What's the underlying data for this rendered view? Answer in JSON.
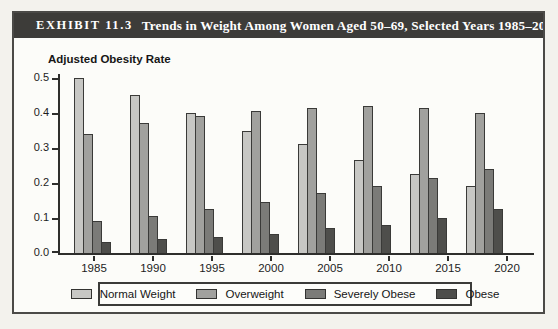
{
  "exhibit": {
    "label": "EXHIBIT 11.3",
    "title": "Trends in Weight Among Women Aged 50–69, Selected Years 1985–2020"
  },
  "chart_data": {
    "type": "bar",
    "title": "Adjusted Obesity Rate",
    "xlabel": "",
    "ylabel": "Adjusted Obesity Rate",
    "ylim": [
      0,
      0.5
    ],
    "yticks": [
      0.0,
      0.1,
      0.2,
      0.3,
      0.4,
      0.5
    ],
    "grid": false,
    "legend_position": "bottom",
    "categories": [
      "1985",
      "1990",
      "1995",
      "2000",
      "2005",
      "2010",
      "2015",
      "2020"
    ],
    "series": [
      {
        "name": "Normal Weight",
        "color": "#c7c7c4",
        "values": [
          0.5,
          0.45,
          0.4,
          0.35,
          0.31,
          0.265,
          0.225,
          0.19
        ]
      },
      {
        "name": "Overweight",
        "color": "#a1a19e",
        "values": [
          0.34,
          0.37,
          0.39,
          0.405,
          0.415,
          0.42,
          0.415,
          0.4
        ]
      },
      {
        "name": "Severely Obese",
        "color": "#7b7b78",
        "values": [
          0.09,
          0.105,
          0.125,
          0.145,
          0.17,
          0.19,
          0.215,
          0.24
        ]
      },
      {
        "name": "Obese",
        "color": "#4e4e4b",
        "values": [
          0.03,
          0.04,
          0.045,
          0.055,
          0.07,
          0.08,
          0.1,
          0.125
        ]
      }
    ]
  }
}
